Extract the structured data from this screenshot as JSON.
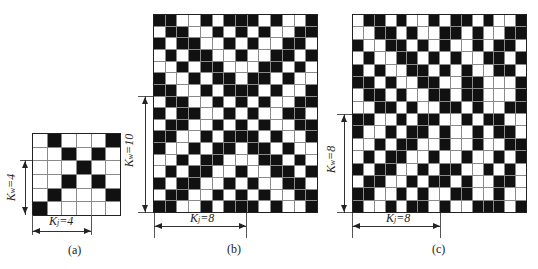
{
  "panels": [
    {
      "id": "a",
      "caption": "(a)",
      "rows": 6,
      "cols": 6,
      "kw_label": "K",
      "kw_sub": "w",
      "kw_value": "=4",
      "kj_label": "K",
      "kj_sub": "j",
      "kj_value": "=4",
      "pattern": [
        "WBWWWB",
        "WWBWBW",
        "WWWBWW",
        "WWBWBW",
        "WBWWWB",
        "BWWWWW"
      ]
    },
    {
      "id": "b",
      "caption": "(b)",
      "rows": 17,
      "cols": 14,
      "kw_label": "K",
      "kw_sub": "w",
      "kw_value": "=10",
      "kj_label": "K",
      "kj_sub": "j",
      "kj_value": "=8",
      "pattern": [
        "BBWWBWBBBWBWWB",
        "WBBWWBWBWBWWBB",
        "BWBBWWBWBWWBBW",
        "WBWBBWWBWWBBWB",
        "WWBWBBWWWBBWBW",
        "BWWBWBBWBBWBWW",
        "BBWWBWBBBWBWWB",
        "WBBWWBWBWBWWBB",
        "BWBBWWBWBWWBBW",
        "WBBWWBWBWBWWBB",
        "BBWWBWBBBWBWWB",
        "BWWBWBBWBBWBWW",
        "WWBWBBWWWBBWBW",
        "WBWBBWWBWWBBWB",
        "BWBBWWBWBWWBBW",
        "WBBWWBWBWBWWBB",
        "BBWWBWBBBWBWWB"
      ]
    },
    {
      "id": "c",
      "caption": "(c)",
      "rows": 16,
      "cols": 16,
      "kw_label": "K",
      "kw_sub": "w",
      "kw_value": "=8",
      "kj_label": "K",
      "kj_sub": "j",
      "kj_value": "=8",
      "pattern": [
        "WBBWBWWBWBBWBWWB",
        "WWBBWBWWBBWBWWBB",
        "BWWBBWBWBWWBWBBW",
        "WBWWBBWBWBWWBBWB",
        "BWBWWBBWBWBWWBBW",
        "BBWBWWBBWWBBWWWB",
        "WBBWBWWBBWBBWWWB",
        "WWBBWBWWBBWBWWBB",
        "BBWWBWBBWWBWBBWW",
        "BWWBWBBWBWWBWBBW",
        "WWBWBBWWBWWBWWBB",
        "WBWBBWWBWWBWWBWB",
        "BWBBWWBWBBWWBWBW",
        "WBBWWBWBBWBWWBBW",
        "BBWWBWBWWBBWWBWW",
        "BWWBWBBWBWWBBBWB"
      ]
    }
  ]
}
